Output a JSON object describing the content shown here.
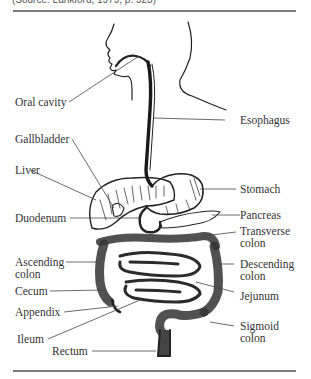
{
  "figure": {
    "caption": "(Source: Lankford, 1979, p. 523)",
    "labels_left": [
      {
        "id": "oral-cavity",
        "text": "Oral cavity"
      },
      {
        "id": "gallbladder",
        "text": "Gallbladder"
      },
      {
        "id": "liver",
        "text": "Liver"
      },
      {
        "id": "duodenum",
        "text": "Duodenum"
      },
      {
        "id": "ascending-colon",
        "line1": "Ascending",
        "line2": "colon"
      },
      {
        "id": "cecum",
        "text": "Cecum"
      },
      {
        "id": "appendix",
        "text": "Appendix"
      },
      {
        "id": "ileum",
        "text": "Ileum"
      },
      {
        "id": "rectum",
        "text": "Rectum"
      }
    ],
    "labels_right": [
      {
        "id": "esophagus",
        "text": "Esophagus"
      },
      {
        "id": "stomach",
        "text": "Stomach"
      },
      {
        "id": "pancreas",
        "text": "Pancreas"
      },
      {
        "id": "transverse-colon",
        "line1": "Transverse",
        "line2": "colon"
      },
      {
        "id": "descending-colon",
        "line1": "Descending",
        "line2": "colon"
      },
      {
        "id": "jejunum",
        "text": "Jejunum"
      },
      {
        "id": "sigmoid-colon",
        "line1": "Sigmoid",
        "line2": "colon"
      }
    ]
  }
}
